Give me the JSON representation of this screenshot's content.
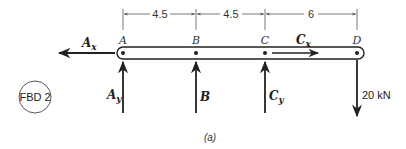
{
  "diagram": {
    "badge": "FBD 2",
    "caption": "(a)",
    "points": [
      {
        "label": "A",
        "x": 123
      },
      {
        "label": "B",
        "x": 196
      },
      {
        "label": "C",
        "x": 265
      },
      {
        "label": "D",
        "x": 357
      }
    ],
    "dimensions": [
      {
        "label": "4.5",
        "from": "A",
        "to": "B"
      },
      {
        "label": "4.5",
        "from": "B",
        "to": "C"
      },
      {
        "label": "6",
        "from": "C",
        "to": "D"
      }
    ],
    "forces": {
      "ax": {
        "main": "A",
        "sub": "x",
        "direction": "left"
      },
      "cx": {
        "main": "C",
        "sub": "x",
        "direction": "right"
      },
      "ay": {
        "main": "A",
        "sub": "y",
        "direction": "up"
      },
      "b": {
        "main": "B",
        "direction": "up"
      },
      "cy": {
        "main": "C",
        "sub": "y",
        "direction": "up"
      },
      "load": {
        "label": "20 kN",
        "direction": "down",
        "at": "D"
      }
    },
    "colors": {
      "ink": "#222222",
      "dim": "#555555"
    }
  }
}
